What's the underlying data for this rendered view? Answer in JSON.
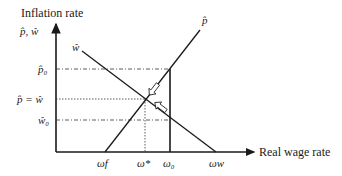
{
  "axes": {
    "y_title": "Inflation rate",
    "y_symbol": "p̂, ŵ",
    "x_title": "Real wage rate"
  },
  "y_ticks": {
    "p0": "p̂₀",
    "equal": "p̂ = ŵ",
    "w0": "ŵ₀"
  },
  "x_ticks": {
    "wf": "ωf",
    "wstar": "ω*",
    "w0": "ω₀",
    "ww": "ωw"
  },
  "curves": {
    "p_hat": "p̂",
    "w_hat": "ŵ"
  },
  "colors": {
    "line": "#1a1a1a",
    "guide": "#333333",
    "background": "#ffffff"
  }
}
